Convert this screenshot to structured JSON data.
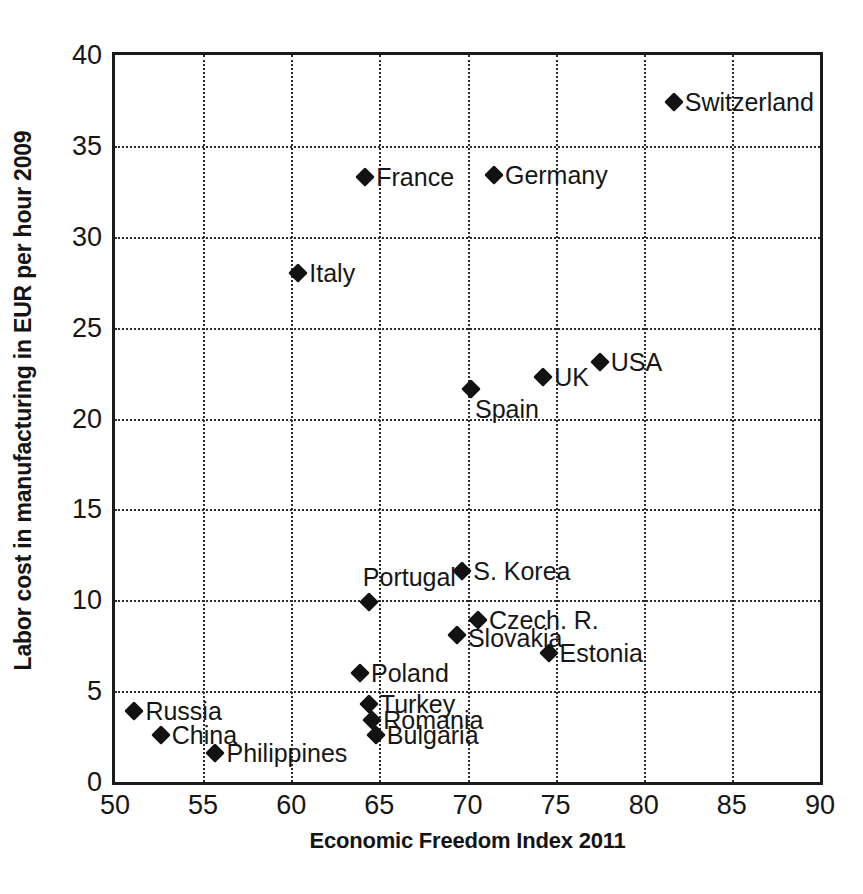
{
  "chart_data": {
    "type": "scatter",
    "title": "",
    "xlabel": "Economic Freedom Index 2011",
    "ylabel": "Labor cost in manufacturing in EUR per hour 2009",
    "xlim": [
      50,
      90
    ],
    "ylim": [
      0,
      40
    ],
    "xticks": [
      "50",
      "55",
      "60",
      "65",
      "70",
      "75",
      "80",
      "85",
      "90"
    ],
    "yticks": [
      "0",
      "5",
      "10",
      "15",
      "20",
      "25",
      "30",
      "35",
      "40"
    ],
    "grid": true,
    "legend": "none",
    "marker": "diamond",
    "marker_color": "#121212",
    "points": [
      {
        "label": "Switzerland",
        "x": 81.7,
        "y": 37.4,
        "label_pos": "right"
      },
      {
        "label": "Germany",
        "x": 71.5,
        "y": 33.4,
        "label_pos": "right"
      },
      {
        "label": "France",
        "x": 64.2,
        "y": 33.3,
        "label_pos": "right"
      },
      {
        "label": "Italy",
        "x": 60.4,
        "y": 28.0,
        "label_pos": "right"
      },
      {
        "label": "USA",
        "x": 77.5,
        "y": 23.1,
        "label_pos": "right"
      },
      {
        "label": "UK",
        "x": 74.3,
        "y": 22.3,
        "label_pos": "right"
      },
      {
        "label": "Spain",
        "x": 70.2,
        "y": 21.6,
        "label_pos": "below-right"
      },
      {
        "label": "S. Korea",
        "x": 69.7,
        "y": 11.6,
        "label_pos": "right"
      },
      {
        "label": "Portugal",
        "x": 64.4,
        "y": 9.9,
        "label_pos": "above"
      },
      {
        "label": "Czech. R.",
        "x": 70.6,
        "y": 8.9,
        "label_pos": "right"
      },
      {
        "label": "Slovakia",
        "x": 69.4,
        "y": 8.1,
        "label_pos": "right-low"
      },
      {
        "label": "Estonia",
        "x": 74.6,
        "y": 7.1,
        "label_pos": "right"
      },
      {
        "label": "Poland",
        "x": 63.9,
        "y": 6.0,
        "label_pos": "right"
      },
      {
        "label": "Turkey",
        "x": 64.4,
        "y": 4.3,
        "label_pos": "right"
      },
      {
        "label": "Russia",
        "x": 51.1,
        "y": 3.9,
        "label_pos": "right"
      },
      {
        "label": "Romania",
        "x": 64.6,
        "y": 3.4,
        "label_pos": "right"
      },
      {
        "label": "Bulgaria",
        "x": 64.8,
        "y": 2.6,
        "label_pos": "right"
      },
      {
        "label": "China",
        "x": 52.6,
        "y": 2.6,
        "label_pos": "right"
      },
      {
        "label": "Philippines",
        "x": 55.7,
        "y": 1.6,
        "label_pos": "right"
      }
    ]
  }
}
